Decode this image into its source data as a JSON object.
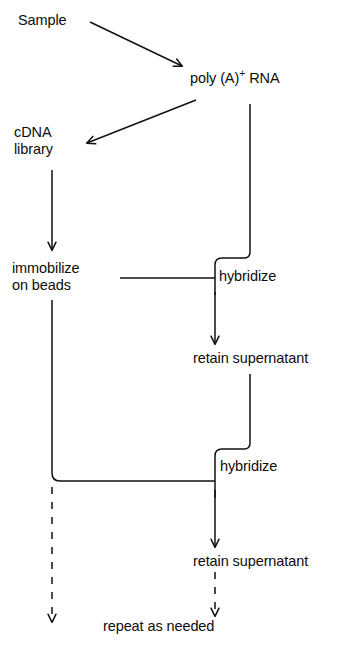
{
  "diagram": {
    "stroke_color": "#111111",
    "background_color": "#ffffff",
    "nodes": {
      "sample": "Sample",
      "poly_a_rna_prefix": "poly (A)",
      "poly_a_rna_superscript": "+",
      "poly_a_rna_suffix": " RNA",
      "cdna_line1": "cDNA",
      "cdna_line2": "library",
      "immobilize_line1": "immobilize",
      "immobilize_line2": "on beads",
      "hybridize_1": "hybridize",
      "retain_supernatant_1": "retain supernatant",
      "hybridize_2": "hybridize",
      "retain_supernatant_2": "retain supernatant",
      "repeat": "repeat as needed"
    },
    "edges": [
      {
        "name": "sample-to-polya",
        "style": "solid",
        "arrow": true
      },
      {
        "name": "polya-to-cdna",
        "style": "solid",
        "arrow": true
      },
      {
        "name": "cdna-to-immobilize",
        "style": "solid",
        "arrow": true
      },
      {
        "name": "polya-down-to-hybridize-1",
        "style": "solid",
        "arrow": false
      },
      {
        "name": "immobilize-to-hybridize-1",
        "style": "solid",
        "arrow": false
      },
      {
        "name": "hybridize-1-to-retain-1",
        "style": "solid",
        "arrow": true
      },
      {
        "name": "immobilize-down-to-hybridize-2",
        "style": "solid",
        "arrow": false
      },
      {
        "name": "retain-1-down-to-hybridize-2",
        "style": "solid",
        "arrow": false
      },
      {
        "name": "hybridize-2-to-retain-2",
        "style": "solid",
        "arrow": true
      },
      {
        "name": "beads-dashed-to-repeat",
        "style": "dashed",
        "arrow": true
      },
      {
        "name": "retain-2-dashed-to-repeat",
        "style": "dashed",
        "arrow": true
      }
    ]
  }
}
